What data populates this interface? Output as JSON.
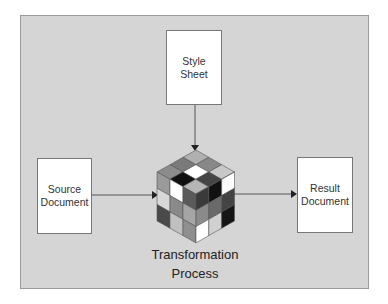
{
  "diagram": {
    "nodes": [
      {
        "id": "style-sheet",
        "lines": [
          "Style",
          "Sheet"
        ]
      },
      {
        "id": "source-document",
        "lines": [
          "Source",
          "Document"
        ]
      },
      {
        "id": "result-document",
        "lines": [
          "Result",
          "Document"
        ]
      },
      {
        "id": "transformation-process",
        "lines": [
          "Transformation",
          "Process"
        ],
        "icon": "rubiks-cube-icon"
      }
    ],
    "edges": [
      {
        "from": "style-sheet",
        "to": "transformation-process"
      },
      {
        "from": "source-document",
        "to": "transformation-process"
      },
      {
        "from": "transformation-process",
        "to": "result-document"
      }
    ]
  },
  "style_sheet": {
    "line1": "Style",
    "line2": "Sheet"
  },
  "source": {
    "line1": "Source",
    "line2": "Document"
  },
  "result": {
    "line1": "Result",
    "line2": "Document"
  },
  "process": {
    "line1": "Transformation",
    "line2": "Process"
  },
  "colors": {
    "background": "#d5d5d5",
    "document_fill": "#ffffff",
    "arrow": "#333333"
  }
}
